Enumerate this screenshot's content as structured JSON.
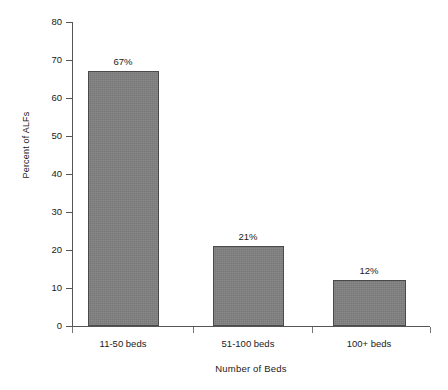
{
  "chart_data": {
    "type": "bar",
    "title": "",
    "subtitle": "",
    "xlabel": "Number of Beds",
    "ylabel": "Percent of ALFs",
    "categories": [
      "11-50 beds",
      "51-100 beds",
      "100+ beds"
    ],
    "values": [
      67,
      21,
      12
    ],
    "data_labels": [
      "67%",
      "21%",
      "12%"
    ],
    "ylim": [
      0,
      80
    ],
    "ytick_values": [
      0,
      10,
      20,
      30,
      40,
      50,
      60,
      70,
      80
    ],
    "ytick_labels": [
      "0",
      "10",
      "20",
      "30",
      "40",
      "50",
      "60",
      "70",
      "80"
    ],
    "grid": false,
    "legend": false,
    "legend_position": "none",
    "bar_color": "#808080",
    "bar_border_color": "#4a4a4a",
    "axis_color": "#555555",
    "background_color": "#ffffff"
  }
}
